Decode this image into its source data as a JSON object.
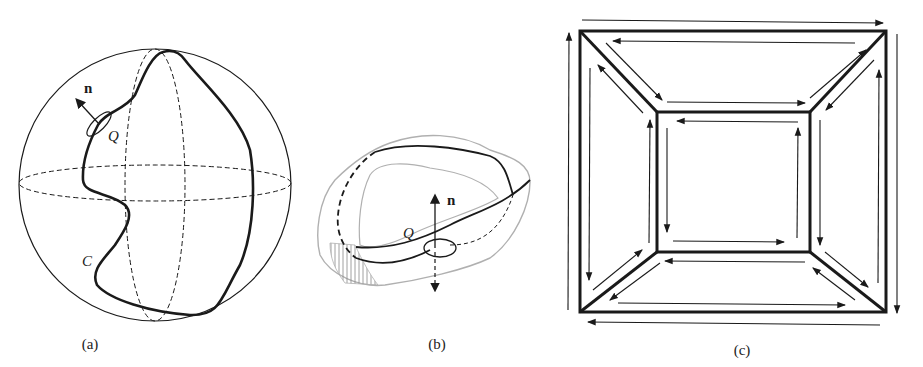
{
  "figure": {
    "panels": [
      {
        "id": "a",
        "caption": "(a)",
        "labels": {
          "normal": "n",
          "point": "Q",
          "curve": "C"
        },
        "description": "Sphere with dashed equator and meridian, closed curve C on surface, small loop at point Q with normal vector n"
      },
      {
        "id": "b",
        "caption": "(b)",
        "labels": {
          "normal": "n",
          "point": "Q"
        },
        "description": "Ring-shaped (Mobius-like) surface drawn in grey, with black boundary curve; small loop at Q with normal n pointing up (solid) and down (dashed)"
      },
      {
        "id": "c",
        "caption": "(c)",
        "description": "Two nested squares connected at corners by diagonals (frustum projection); each face bounded by arrows showing orientation"
      }
    ],
    "colors": {
      "ink": "#1a1a1a",
      "surface_grey": "#b0b0b0",
      "background": "#ffffff"
    }
  }
}
